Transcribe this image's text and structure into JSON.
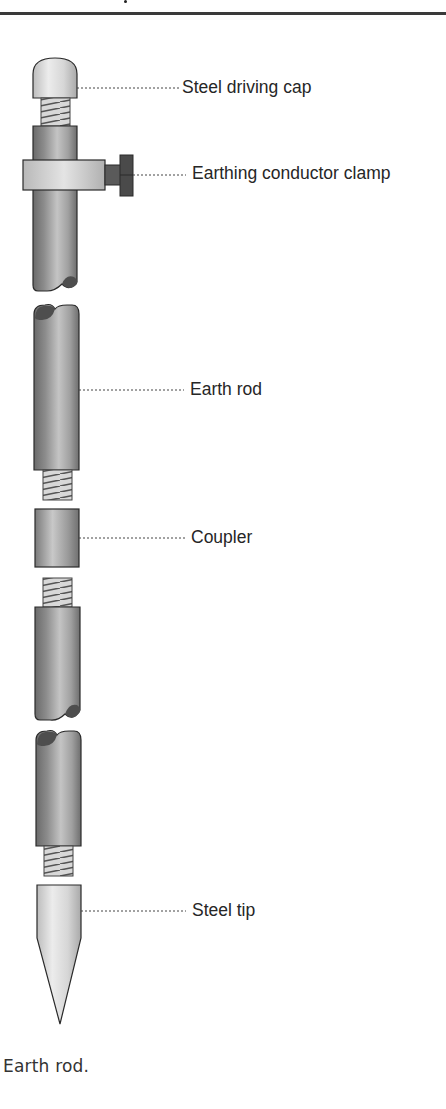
{
  "figure": {
    "caption": "Earth rod.",
    "labels": {
      "cap": "Steel driving cap",
      "clamp": "Earthing conductor clamp",
      "rod": "Earth rod",
      "coupler": "Coupler",
      "tip": "Steel tip"
    },
    "components": [
      {
        "id": "steel-driving-cap",
        "label": "Steel driving cap"
      },
      {
        "id": "earthing-conductor-clamp",
        "label": "Earthing conductor clamp"
      },
      {
        "id": "earth-rod",
        "label": "Earth rod"
      },
      {
        "id": "coupler",
        "label": "Coupler"
      },
      {
        "id": "steel-tip",
        "label": "Steel tip"
      }
    ],
    "colors": {
      "metal_dark": "#6e6e6e",
      "metal_mid": "#a8a8a8",
      "metal_light": "#d9d9d9",
      "outline": "#2a2a2a",
      "text": "#262626",
      "rule": "#3a3a3a"
    }
  }
}
